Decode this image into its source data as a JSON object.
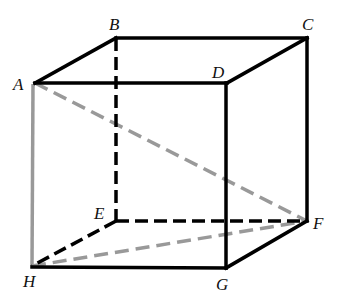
{
  "diagram": {
    "type": "cube",
    "colors": {
      "solid": "#000000",
      "hidden": "#000000",
      "diagonal": "#999999",
      "background": "#ffffff"
    },
    "vertices": {
      "A": {
        "x": 35,
        "y": 83
      },
      "B": {
        "x": 116,
        "y": 38
      },
      "C": {
        "x": 307,
        "y": 38
      },
      "D": {
        "x": 227,
        "y": 83
      },
      "E": {
        "x": 116,
        "y": 221
      },
      "F": {
        "x": 307,
        "y": 221
      },
      "G": {
        "x": 226,
        "y": 268
      },
      "H": {
        "x": 32,
        "y": 266
      }
    },
    "labels": {
      "A": "A",
      "B": "B",
      "C": "C",
      "D": "D",
      "E": "E",
      "F": "F",
      "G": "G",
      "H": "H"
    },
    "edges": {
      "solid": [
        "A-B",
        "B-C",
        "A-D",
        "C-D",
        "D-G",
        "C-F",
        "F-G",
        "H-G"
      ],
      "hidden_dashed": [
        "B-E",
        "E-F",
        "E-H"
      ],
      "gray_solid": [
        "A-H"
      ],
      "gray_dashed": [
        "A-F",
        "H-F"
      ]
    }
  }
}
